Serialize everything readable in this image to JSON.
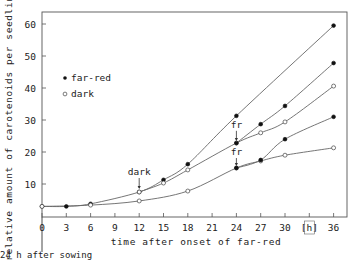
{
  "chart_data": {
    "type": "line",
    "title": "",
    "xlabel": "time after onset of far-red",
    "x_unit_label": "[h]",
    "ylabel": "relative amount of carotenoids per seedling",
    "xlim": [
      0,
      37
    ],
    "ylim": [
      0,
      62
    ],
    "x_ticks": [
      0,
      3,
      6,
      9,
      12,
      15,
      18,
      21,
      24,
      27,
      30,
      33,
      36
    ],
    "x_tick_labels": [
      "0",
      "3",
      "6",
      "9",
      "12",
      "15",
      "18",
      "21",
      "24",
      "27",
      "30",
      "[h]",
      "36"
    ],
    "y_ticks": [
      10,
      20,
      30,
      40,
      50,
      60
    ],
    "y_tick_labels": [
      "10",
      "20",
      "30",
      "40",
      "50",
      "60"
    ],
    "grid": false,
    "legend": [
      {
        "marker": "filled",
        "label": "far-red"
      },
      {
        "marker": "open",
        "label": "dark"
      }
    ],
    "legend_position": "upper-left",
    "annotations": [
      {
        "text": "dark",
        "x": 12,
        "y": 7.5,
        "type": "arrow-down"
      },
      {
        "text": "fr",
        "x": 24,
        "y": 31.3,
        "type": "arrow-down-to",
        "target_y": 22.8
      },
      {
        "text": "fr",
        "x": 24,
        "y": 22.8,
        "type": "arrow-down-to",
        "target_y": 15
      },
      {
        "text": "24 h after sowing",
        "x": 0,
        "type": "below-axis-marker"
      }
    ],
    "series": [
      {
        "name": "far-red continuous",
        "marker": "filled",
        "x": [
          0,
          3,
          6,
          12,
          15,
          18,
          24,
          36
        ],
        "values": [
          3,
          3,
          3.8,
          7.5,
          11.3,
          16.2,
          31.3,
          59.5
        ]
      },
      {
        "name": "far-red 12 h then dark",
        "marker": "open",
        "x": [
          12,
          15,
          18,
          24,
          27,
          30,
          36
        ],
        "values": [
          7.5,
          10.3,
          14.4,
          22.8,
          26,
          29.4,
          40.6
        ]
      },
      {
        "name": "far-red 12 h, dark, far-red from 24 h",
        "marker": "filled",
        "x": [
          24,
          27,
          30,
          36
        ],
        "values": [
          22.8,
          28.7,
          34.4,
          47.8
        ]
      },
      {
        "name": "dark",
        "marker": "open",
        "x": [
          0,
          6,
          12,
          18,
          24,
          27,
          30,
          36
        ],
        "values": [
          3,
          3.4,
          4.7,
          7.8,
          15,
          17.2,
          19,
          21.3
        ]
      },
      {
        "name": "dark then far-red from 24 h",
        "marker": "filled",
        "x": [
          24,
          27,
          30,
          36
        ],
        "values": [
          15,
          17.5,
          24,
          31
        ]
      }
    ]
  },
  "labels": {
    "sowing_note": "24 h after sowing"
  }
}
